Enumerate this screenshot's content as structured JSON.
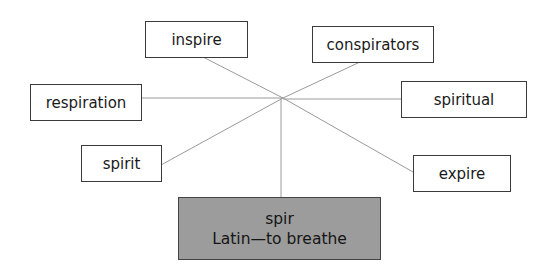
{
  "diagram": {
    "type": "word-web",
    "root": {
      "line1": "spir",
      "line2": "Latin—to breathe",
      "fill": "#9c9c9c"
    },
    "derivatives": [
      {
        "id": "inspire",
        "label": "inspire"
      },
      {
        "id": "conspirators",
        "label": "conspirators"
      },
      {
        "id": "respiration",
        "label": "respiration"
      },
      {
        "id": "spiritual",
        "label": "spiritual"
      },
      {
        "id": "spirit",
        "label": "spirit"
      },
      {
        "id": "expire",
        "label": "expire"
      }
    ],
    "line_color": "#9a9a9a"
  }
}
